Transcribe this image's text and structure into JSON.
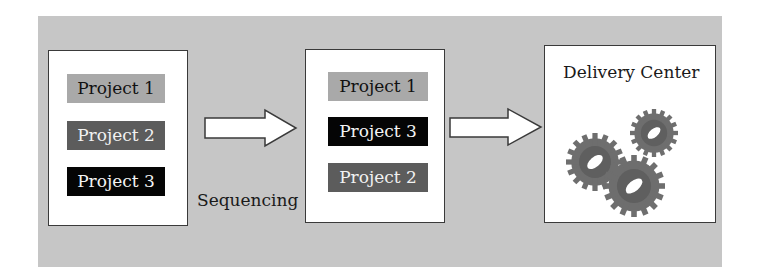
{
  "diagram": {
    "stage1": {
      "projects": [
        {
          "label": "Project 1",
          "shade": "light"
        },
        {
          "label": "Project 2",
          "shade": "mid"
        },
        {
          "label": "Project 3",
          "shade": "dark"
        }
      ]
    },
    "transition_label": "Sequencing",
    "stage2": {
      "projects": [
        {
          "label": "Project 1",
          "shade": "light"
        },
        {
          "label": "Project 3",
          "shade": "dark"
        },
        {
          "label": "Project 2",
          "shade": "mid"
        }
      ]
    },
    "stage3": {
      "title": "Delivery Center",
      "icon": "gears-icon"
    },
    "colors": {
      "background": "#c6c6c6",
      "light_block": "#a9a9a9",
      "mid_block": "#5c5c5c",
      "dark_block": "#050505",
      "gear": "#6e6e6e"
    }
  }
}
